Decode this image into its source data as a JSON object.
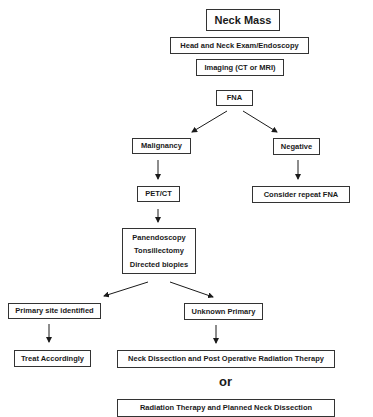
{
  "diagram": {
    "type": "flowchart",
    "nodes": {
      "neck_mass": "Neck Mass",
      "head_neck_exam": "Head and Neck Exam/Endoscopy",
      "imaging": "Imaging (CT or MRI)",
      "fna": "FNA",
      "malignancy": "Malignancy",
      "negative": "Negative",
      "pet_ct": "PET/CT",
      "consider_repeat_fna": "Consider repeat FNA",
      "procedures": [
        "Panendoscopy",
        "Tonsillectomy",
        "Directed biopies"
      ],
      "primary_site_identified": "Primary site identified",
      "unknown_primary": "Unknown Primary",
      "treat_accordingly": "Treat Accordingly",
      "neck_dissection_post_op_rt": "Neck Dissection and Post Operative Radiation Therapy",
      "or_label": "or",
      "rt_planned_neck_dissection": "Radiation Therapy and Planned Neck Dissection"
    },
    "edges": [
      [
        "fna",
        "malignancy"
      ],
      [
        "fna",
        "negative"
      ],
      [
        "malignancy",
        "pet_ct"
      ],
      [
        "negative",
        "consider_repeat_fna"
      ],
      [
        "pet_ct",
        "procedures"
      ],
      [
        "procedures",
        "primary_site_identified"
      ],
      [
        "procedures",
        "unknown_primary"
      ],
      [
        "primary_site_identified",
        "treat_accordingly"
      ],
      [
        "unknown_primary",
        "neck_dissection_post_op_rt"
      ]
    ]
  }
}
